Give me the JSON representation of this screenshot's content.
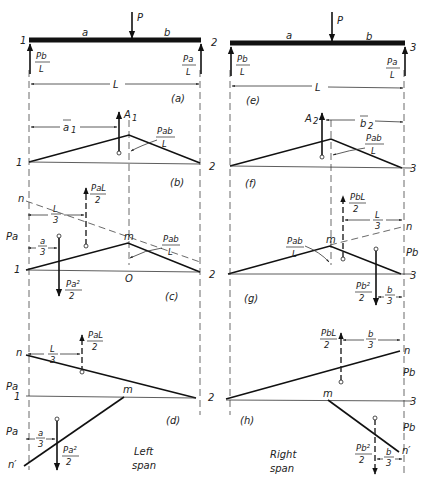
{
  "figure": {
    "left_span_caption": [
      "Left",
      "span"
    ],
    "right_span_caption": [
      "Right",
      "span"
    ]
  },
  "left": {
    "a": {
      "caption": "(a)",
      "support_left": "1",
      "support_right": "2",
      "load": "P",
      "seg_a": "a",
      "seg_b": "b",
      "reaction_left": {
        "num": "Pb",
        "den": "L"
      },
      "reaction_right": {
        "num": "Pa",
        "den": "L"
      },
      "span": "L"
    },
    "b": {
      "caption": "(b)",
      "left": "1",
      "area": "A",
      "area_sub": "1",
      "centroid": "a",
      "centroid_sub": "1",
      "peak": {
        "num": "Pab",
        "den": "L"
      }
    },
    "c": {
      "caption": "(c)",
      "left": "1",
      "n": "n",
      "m": "m",
      "o": "O",
      "pa": "Pa",
      "upper_force": {
        "num": "PaL",
        "den": "2"
      },
      "upper_dist": {
        "num": "L",
        "den": "3"
      },
      "lower_dist": {
        "num": "a",
        "den": "3"
      },
      "lower_force": {
        "num": "Pa²",
        "den": "2"
      },
      "peak": {
        "num": "Pab",
        "den": "L"
      }
    },
    "d": {
      "caption": "(d)",
      "left": "1",
      "right": "2",
      "n": "n",
      "n_prime": "n′",
      "m": "m",
      "pa_top": "Pa",
      "pa_bottom": "Pa",
      "upper_force": {
        "num": "PaL",
        "den": "2"
      },
      "upper_dist": {
        "num": "L",
        "den": "3"
      },
      "lower_dist": {
        "num": "a",
        "den": "3"
      },
      "lower_force": {
        "num": "Pa²",
        "den": "2"
      }
    }
  },
  "right": {
    "e": {
      "caption": "(e)",
      "support_left": "2",
      "support_right": "3",
      "load": "P",
      "seg_a": "a",
      "seg_b": "b",
      "reaction_left": {
        "num": "Pb",
        "den": "L"
      },
      "reaction_right": {
        "num": "Pa",
        "den": "L"
      },
      "span": "L"
    },
    "f": {
      "caption": "(f)",
      "left": "2",
      "right": "3",
      "area": "A",
      "area_sub": "2",
      "centroid": "b",
      "centroid_sub": "2",
      "peak": {
        "num": "Pab",
        "den": "L"
      }
    },
    "g": {
      "caption": "(g)",
      "left": "2",
      "right": "3",
      "n": "n",
      "m": "m",
      "pb": "Pb",
      "upper_force": {
        "num": "PbL",
        "den": "2"
      },
      "upper_dist": {
        "num": "L",
        "den": "3"
      },
      "lower_dist": {
        "num": "b",
        "den": "3"
      },
      "lower_force": {
        "num": "Pb²",
        "den": "2"
      },
      "peak": {
        "num": "Pab",
        "den": "L"
      }
    },
    "h": {
      "caption": "(h)",
      "right": "3",
      "n": "n",
      "n_prime": "n′",
      "m": "m",
      "pb_top": "Pb",
      "pb_bottom": "Pb",
      "upper_force": {
        "num": "PbL",
        "den": "2"
      },
      "upper_dist": {
        "num": "b",
        "den": "3"
      },
      "lower_dist": {
        "num": "b",
        "den": "3"
      },
      "lower_force": {
        "num": "Pb²",
        "den": "2"
      }
    }
  }
}
